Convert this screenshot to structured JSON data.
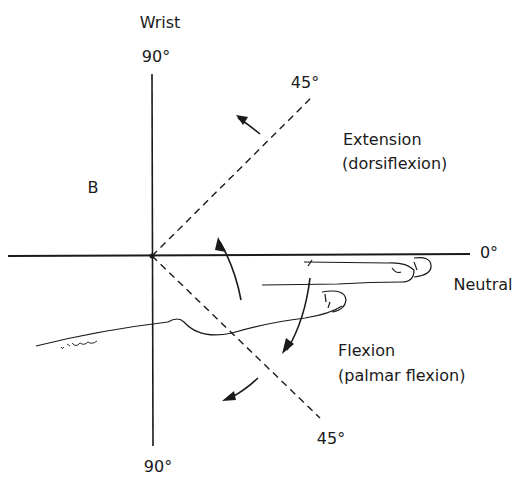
{
  "figure": {
    "title": "Wrist",
    "panel_label": "B",
    "axis_labels": {
      "top": "90°",
      "bottom": "90°",
      "right": "0°",
      "right_sub": "Neutral"
    },
    "diagonal_labels": {
      "upper": "45°",
      "lower": "45°"
    },
    "motions": {
      "extension": {
        "line1": "Extension",
        "line2": "(dorsiflexion)"
      },
      "flexion": {
        "line1": "Flexion",
        "line2": "(palmar flexion)"
      }
    },
    "colors": {
      "ink": "#1a1a1a",
      "background": "#ffffff"
    }
  }
}
